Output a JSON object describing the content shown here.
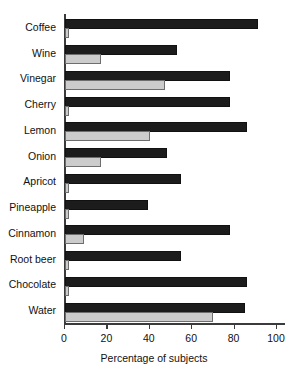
{
  "chart_data": {
    "type": "bar",
    "orientation": "horizontal",
    "title": "",
    "xlabel": "Percentage of subjects",
    "ylabel": "",
    "xlim": [
      0,
      100
    ],
    "xticks": [
      0,
      20,
      40,
      60,
      80,
      100
    ],
    "grid": false,
    "legend": null,
    "categories": [
      "Coffee",
      "Wine",
      "Vinegar",
      "Cherry",
      "Lemon",
      "Onion",
      "Apricot",
      "Pineapple",
      "Cinnamon",
      "Root beer",
      "Chocolate",
      "Water"
    ],
    "series": [
      {
        "name": "dark",
        "color": "#1c1c1c",
        "values": [
          90,
          52,
          77,
          77,
          85,
          47,
          54,
          38,
          77,
          54,
          85,
          84
        ]
      },
      {
        "name": "light",
        "color": "#cccccc",
        "values": [
          1,
          16,
          46,
          1,
          39,
          16,
          1,
          1,
          8,
          1,
          1,
          69
        ]
      }
    ]
  },
  "axis": {
    "x_title": "Percentage of subjects",
    "tick_labels": [
      "0",
      "20",
      "40",
      "60",
      "80",
      "100"
    ]
  },
  "colors": {
    "dark_bar": "#1c1c1c",
    "light_bar": "#cccccc",
    "axis": "#3b3b3b",
    "text": "#111111",
    "background": "#ffffff"
  }
}
